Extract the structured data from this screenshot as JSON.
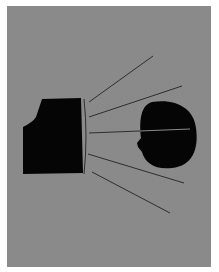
{
  "caption_fragment": "",
  "illustration": {
    "description": "Camera-like black box emitting lines toward a black head silhouette",
    "colors": {
      "background": "#8a8a8a",
      "shape": "#050505",
      "line": "#2e2e2e",
      "line_through_head": "#8a8a8a"
    },
    "panel": {
      "x": 7,
      "y": 6,
      "width": 204,
      "height": 261
    },
    "box_path": "M42,99 L81,98 L83,173 L23,174 L23,127 Q33,122 36,117 Z",
    "lens_arc": "M84,99 Q88,136 84,174",
    "head_path": "M152,102 C175,98 194,108 196,128 C199,150 192,166 172,168 C155,170 145,163 142,152 L138,147 L137,143 L141,138 C139,120 141,105 152,102 Z",
    "rays": [
      {
        "x1": 89,
        "y1": 102,
        "x2": 153,
        "y2": 56
      },
      {
        "x1": 89,
        "y1": 117,
        "x2": 182,
        "y2": 86
      },
      {
        "x1": 89,
        "y1": 133,
        "x2": 190,
        "y2": 129
      },
      {
        "x1": 88,
        "y1": 154,
        "x2": 184,
        "y2": 183
      },
      {
        "x1": 92,
        "y1": 172,
        "x2": 170,
        "y2": 213
      }
    ]
  }
}
